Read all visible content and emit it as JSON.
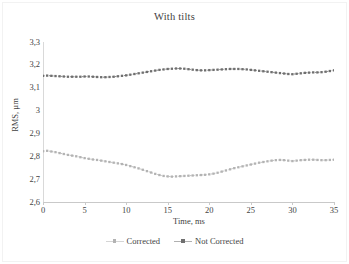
{
  "chart_data": {
    "type": "line",
    "title": "With tilts",
    "xlabel": "Time, ms",
    "ylabel": "RMS, µm",
    "xlim": [
      0,
      35
    ],
    "ylim": [
      2.6,
      3.3
    ],
    "grid": false,
    "legend_position": "bottom",
    "xticks": [
      "0",
      "5",
      "10",
      "15",
      "20",
      "25",
      "30",
      "35"
    ],
    "xtick_values": [
      0,
      5,
      10,
      15,
      20,
      25,
      30,
      35
    ],
    "yticks": [
      "2,6",
      "2,7",
      "2,8",
      "2,9",
      "3",
      "3,1",
      "3,2",
      "3,3"
    ],
    "ytick_values": [
      2.6,
      2.7,
      2.8,
      2.9,
      3.0,
      3.1,
      3.2,
      3.3
    ],
    "x": [
      0,
      0.5,
      1,
      1.5,
      2,
      2.5,
      3,
      3.5,
      4,
      4.5,
      5,
      5.5,
      6,
      6.5,
      7,
      7.5,
      8,
      8.5,
      9,
      9.5,
      10,
      10.5,
      11,
      11.5,
      12,
      12.5,
      13,
      13.5,
      14,
      14.5,
      15,
      15.5,
      16,
      16.5,
      17,
      17.5,
      18,
      18.5,
      19,
      19.5,
      20,
      20.5,
      21,
      21.5,
      22,
      22.5,
      23,
      23.5,
      24,
      24.5,
      25,
      25.5,
      26,
      26.5,
      27,
      27.5,
      28,
      28.5,
      29,
      29.5,
      30,
      30.5,
      31,
      31.5,
      32,
      32.5,
      33,
      33.5,
      34,
      34.5,
      35
    ],
    "series": [
      {
        "name": "Corrected",
        "color": "#b3b3b3",
        "marker": "square",
        "values": [
          2.822,
          2.824,
          2.821,
          2.818,
          2.814,
          2.81,
          2.806,
          2.803,
          2.8,
          2.796,
          2.792,
          2.789,
          2.786,
          2.784,
          2.781,
          2.778,
          2.775,
          2.772,
          2.769,
          2.766,
          2.762,
          2.757,
          2.752,
          2.747,
          2.741,
          2.735,
          2.729,
          2.723,
          2.718,
          2.714,
          2.712,
          2.711,
          2.712,
          2.713,
          2.714,
          2.715,
          2.716,
          2.717,
          2.718,
          2.719,
          2.721,
          2.724,
          2.728,
          2.733,
          2.738,
          2.743,
          2.748,
          2.752,
          2.756,
          2.76,
          2.764,
          2.768,
          2.772,
          2.775,
          2.778,
          2.781,
          2.783,
          2.784,
          2.783,
          2.781,
          2.779,
          2.781,
          2.783,
          2.784,
          2.785,
          2.785,
          2.784,
          2.783,
          2.783,
          2.784,
          2.785
        ]
      },
      {
        "name": "Not Corrected",
        "color": "#6f6f6f",
        "marker": "square",
        "values": [
          3.152,
          3.153,
          3.152,
          3.151,
          3.15,
          3.149,
          3.148,
          3.148,
          3.148,
          3.148,
          3.149,
          3.149,
          3.148,
          3.147,
          3.146,
          3.146,
          3.147,
          3.148,
          3.15,
          3.152,
          3.154,
          3.157,
          3.16,
          3.163,
          3.166,
          3.169,
          3.172,
          3.175,
          3.178,
          3.18,
          3.182,
          3.183,
          3.184,
          3.184,
          3.183,
          3.181,
          3.179,
          3.177,
          3.176,
          3.176,
          3.177,
          3.178,
          3.179,
          3.18,
          3.181,
          3.182,
          3.182,
          3.182,
          3.181,
          3.18,
          3.178,
          3.176,
          3.174,
          3.172,
          3.17,
          3.168,
          3.166,
          3.164,
          3.162,
          3.16,
          3.159,
          3.161,
          3.163,
          3.165,
          3.166,
          3.167,
          3.167,
          3.168,
          3.17,
          3.173,
          3.176
        ]
      }
    ]
  }
}
